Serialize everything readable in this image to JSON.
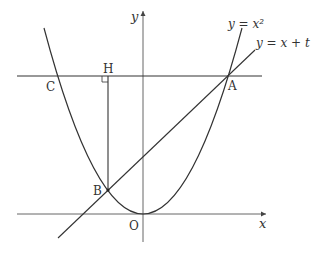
{
  "diagram": {
    "axes": {
      "x_label": "x",
      "y_label": "y",
      "origin_label": "O"
    },
    "curves": {
      "parabola_label": "y = x²",
      "line_label": "y = x + t"
    },
    "points": {
      "A": "A",
      "B": "B",
      "C": "C",
      "H": "H"
    },
    "colors": {
      "stroke": "#333333",
      "axis": "#555555",
      "background": "#ffffff"
    }
  }
}
